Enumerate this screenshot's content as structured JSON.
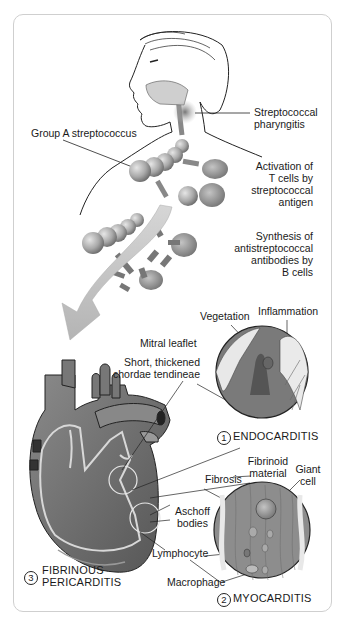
{
  "diagram": {
    "labels": {
      "group_a": "Group A streptococcus",
      "pharyngitis_1": "Streptococcal",
      "pharyngitis_2": "pharyngitis",
      "tcell_1": "Activation of",
      "tcell_2": "T cells by",
      "tcell_3": "streptococcal",
      "tcell_4": "antigen",
      "bcell_1": "Synthesis of",
      "bcell_2": "antistreptococcal",
      "bcell_3": "antibodies by",
      "bcell_4": "B cells",
      "vegetation": "Vegetation",
      "inflammation": "Inflammation",
      "mitral": "Mitral leaflet",
      "chordae_1": "Short, thickened",
      "chordae_2": "chordae tendineae",
      "fibrinoid_1": "Fibrinoid",
      "fibrinoid_2": "material",
      "giant_1": "Giant",
      "giant_2": "cell",
      "fibrosis": "Fibrosis",
      "aschoff_1": "Aschoff",
      "aschoff_2": "bodies",
      "lymphocyte": "Lymphocyte",
      "macrophage": "Macrophage"
    },
    "panels": [
      {
        "number": "1",
        "name": "ENDOCARDITIS"
      },
      {
        "number": "2",
        "name": "MYOCARDITIS"
      },
      {
        "number": "3",
        "name_line1": "FIBRINOUS",
        "name_line2": "PERICARDITIS"
      }
    ],
    "colors": {
      "border": "#cfcfcf",
      "tissue_dark": "#6e6e6e",
      "tissue_mid": "#9a9a9a",
      "tissue_light": "#c8c8c8",
      "text": "#1a1a1a"
    }
  }
}
